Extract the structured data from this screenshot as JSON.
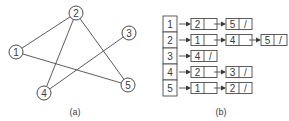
{
  "graph": {
    "caption": "(a)",
    "nodes": [
      {
        "id": "1",
        "x": 16,
        "y": 52
      },
      {
        "id": "2",
        "x": 76,
        "y": 13
      },
      {
        "id": "3",
        "x": 129,
        "y": 33
      },
      {
        "id": "4",
        "x": 44,
        "y": 93
      },
      {
        "id": "5",
        "x": 128,
        "y": 85
      }
    ],
    "edges": [
      [
        "1",
        "2"
      ],
      [
        "1",
        "5"
      ],
      [
        "2",
        "4"
      ],
      [
        "2",
        "5"
      ],
      [
        "3",
        "4"
      ]
    ]
  },
  "adjacency_list": {
    "caption": "(b)",
    "rows": [
      {
        "vertex": "1",
        "list": [
          "2",
          "5"
        ]
      },
      {
        "vertex": "2",
        "list": [
          "1",
          "4",
          "5"
        ]
      },
      {
        "vertex": "3",
        "list": [
          "4"
        ]
      },
      {
        "vertex": "4",
        "list": [
          "2",
          "3"
        ]
      },
      {
        "vertex": "5",
        "list": [
          "1",
          "2"
        ]
      }
    ],
    "null_marker": "/"
  },
  "colors": {
    "stroke": "#4a4a4a",
    "text": "#3a3a3a",
    "background": "#ffffff"
  }
}
